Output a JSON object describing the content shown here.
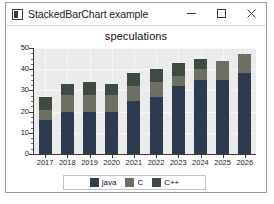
{
  "window": {
    "title": "StackedBarChart example",
    "icon": "app-icon",
    "controls": [
      {
        "name": "minimize",
        "glyph": "minimize-icon"
      },
      {
        "name": "maximize",
        "glyph": "maximize-icon"
      },
      {
        "name": "close",
        "glyph": "close-icon"
      }
    ]
  },
  "colors": {
    "java": "#2e3b4e",
    "c": "#6d6f63",
    "cpp": "#3f4a42",
    "plot_background": "#ebebeb",
    "grid": "#f7f7f7",
    "axis": "#3a3a3a"
  },
  "chart_data": {
    "type": "bar",
    "title": "speculations",
    "xlabel": "",
    "ylabel": "",
    "stacked": true,
    "grid": true,
    "legend_position": "bottom",
    "ylim": [
      0,
      50
    ],
    "yticks": [
      0,
      10,
      20,
      30,
      40,
      50
    ],
    "categories": [
      "2017",
      "2018",
      "2019",
      "2020",
      "2021",
      "2022",
      "2023",
      "2024",
      "2025",
      "2026"
    ],
    "series": [
      {
        "name": "java",
        "color": "#2e3b4e",
        "values": [
          16,
          20,
          20,
          20,
          25,
          27,
          32,
          35,
          35,
          38
        ]
      },
      {
        "name": "C",
        "color": "#6d6f63",
        "values": [
          5,
          8,
          8,
          8,
          7,
          7,
          5,
          5,
          9,
          9
        ]
      },
      {
        "name": "C++",
        "color": "#3f4a42",
        "values": [
          6,
          5,
          6,
          5,
          6,
          6,
          6,
          5,
          0,
          0
        ]
      }
    ],
    "totals": [
      27,
      33,
      34,
      33,
      38,
      40,
      43,
      45,
      44,
      47
    ]
  },
  "legend": {
    "items": [
      {
        "label": "java",
        "color": "#2e3b4e"
      },
      {
        "label": "C",
        "color": "#6d6f63"
      },
      {
        "label": "C++",
        "color": "#3f4a42"
      }
    ]
  }
}
